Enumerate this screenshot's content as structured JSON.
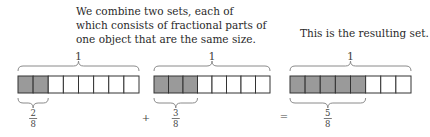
{
  "captions": {
    "left": [
      "We combine two sets, each of",
      "which consists of fractional parts of",
      "one object that are the same size."
    ],
    "right": "This is the resulting set."
  },
  "operators": {
    "plus": "+",
    "equals": "="
  },
  "colors": {
    "shaded": "#9a9a9a",
    "unshaded": "#ffffff",
    "border": "#333333",
    "brace": "#8a8a8a"
  },
  "bars": [
    {
      "name": "set-a",
      "whole_label": "1",
      "parts": 8,
      "shaded": 2,
      "numerator": "2",
      "denominator": "8"
    },
    {
      "name": "set-b",
      "whole_label": "1",
      "parts": 8,
      "shaded": 3,
      "numerator": "3",
      "denominator": "8"
    },
    {
      "name": "result",
      "whole_label": "1",
      "parts": 8,
      "shaded": 5,
      "numerator": "5",
      "denominator": "8"
    }
  ]
}
